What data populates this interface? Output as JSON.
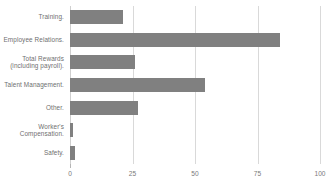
{
  "chart_data": {
    "type": "bar",
    "orientation": "horizontal",
    "title": "",
    "subtitle": "",
    "xlabel": "",
    "ylabel": "",
    "categories": [
      "Training.",
      "Employee Relations.",
      "Total Rewards\n(including payroll).",
      "Talent Management.",
      "Other.",
      "Worker's\nCompensation.",
      "Safety."
    ],
    "values": [
      21,
      84,
      26,
      54,
      27,
      1,
      2
    ],
    "xlim": [
      0,
      100
    ],
    "xticks": [
      0,
      25,
      50,
      75,
      100
    ],
    "xtick_labels": [
      "0",
      "25",
      "50",
      "75",
      "100"
    ],
    "grid": true,
    "grid_axis": "x",
    "legend": false,
    "legend_position": "none",
    "bar_color": "#808080",
    "gridline_color": "#d9d9d9",
    "text_color": "#6f6f6f",
    "background_color": "#ffffff"
  }
}
